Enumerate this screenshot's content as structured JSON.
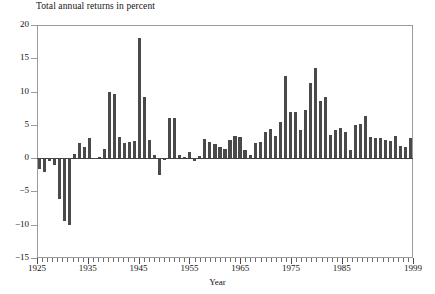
{
  "chart_data": {
    "type": "bar",
    "title": "Total annual returns in percent",
    "xlabel": "Year",
    "ylabel": "",
    "ylim": [
      -15,
      20
    ],
    "yticks": [
      -15,
      -10,
      -5,
      0,
      5,
      10,
      15,
      20
    ],
    "ytick_labels": [
      "−15",
      "−10",
      "−5",
      "0",
      "5",
      "10",
      "15",
      "20"
    ],
    "xlim": [
      1925,
      1999
    ],
    "xticks_major": [
      1925,
      1935,
      1945,
      1955,
      1965,
      1975,
      1985,
      1999
    ],
    "xtick_labels": [
      "1925",
      "1935",
      "1945",
      "1955",
      "1965",
      "1975",
      "1985",
      "1999"
    ],
    "xtick_minor_step": 1,
    "grid": false,
    "legend": null,
    "bar_color": "#4a4a4a",
    "frame_color": "#9b9b9b",
    "categories": [
      1925,
      1926,
      1927,
      1928,
      1929,
      1930,
      1931,
      1932,
      1933,
      1934,
      1935,
      1936,
      1937,
      1938,
      1939,
      1940,
      1941,
      1942,
      1943,
      1944,
      1945,
      1946,
      1947,
      1948,
      1949,
      1950,
      1951,
      1952,
      1953,
      1954,
      1955,
      1956,
      1957,
      1958,
      1959,
      1960,
      1961,
      1962,
      1963,
      1964,
      1965,
      1966,
      1967,
      1968,
      1969,
      1970,
      1971,
      1972,
      1973,
      1974,
      1975,
      1976,
      1977,
      1978,
      1979,
      1980,
      1981,
      1982,
      1983,
      1984,
      1985,
      1986,
      1987,
      1988,
      1989,
      1990,
      1991,
      1992,
      1993,
      1994,
      1995,
      1996,
      1997,
      1998,
      1999
    ],
    "values": [
      -1.6,
      -2.1,
      -0.4,
      -1.0,
      -6.2,
      -9.4,
      -10.1,
      0.6,
      2.3,
      1.6,
      3.1,
      -0.1,
      0.2,
      1.4,
      9.9,
      9.6,
      3.2,
      2.3,
      2.4,
      2.6,
      18.1,
      9.2,
      2.8,
      0.5,
      -2.6,
      -0.3,
      6.0,
      6.1,
      0.5,
      0.2,
      0.9,
      -0.4,
      0.3,
      2.9,
      2.4,
      2.1,
      1.7,
      1.4,
      2.8,
      3.4,
      3.2,
      1.2,
      0.5,
      2.2,
      2.4,
      3.9,
      4.4,
      3.3,
      5.4,
      12.4,
      7.0,
      6.9,
      4.2,
      7.3,
      11.3,
      13.5,
      8.6,
      9.2,
      3.5,
      4.2,
      4.6,
      4.0,
      1.2,
      5.0,
      5.2,
      6.4,
      3.2,
      3.1,
      3.0,
      2.7,
      2.6,
      3.4,
      1.8,
      1.7,
      3.0
    ]
  },
  "axis": {
    "y_title": "",
    "x_title": "Year"
  }
}
